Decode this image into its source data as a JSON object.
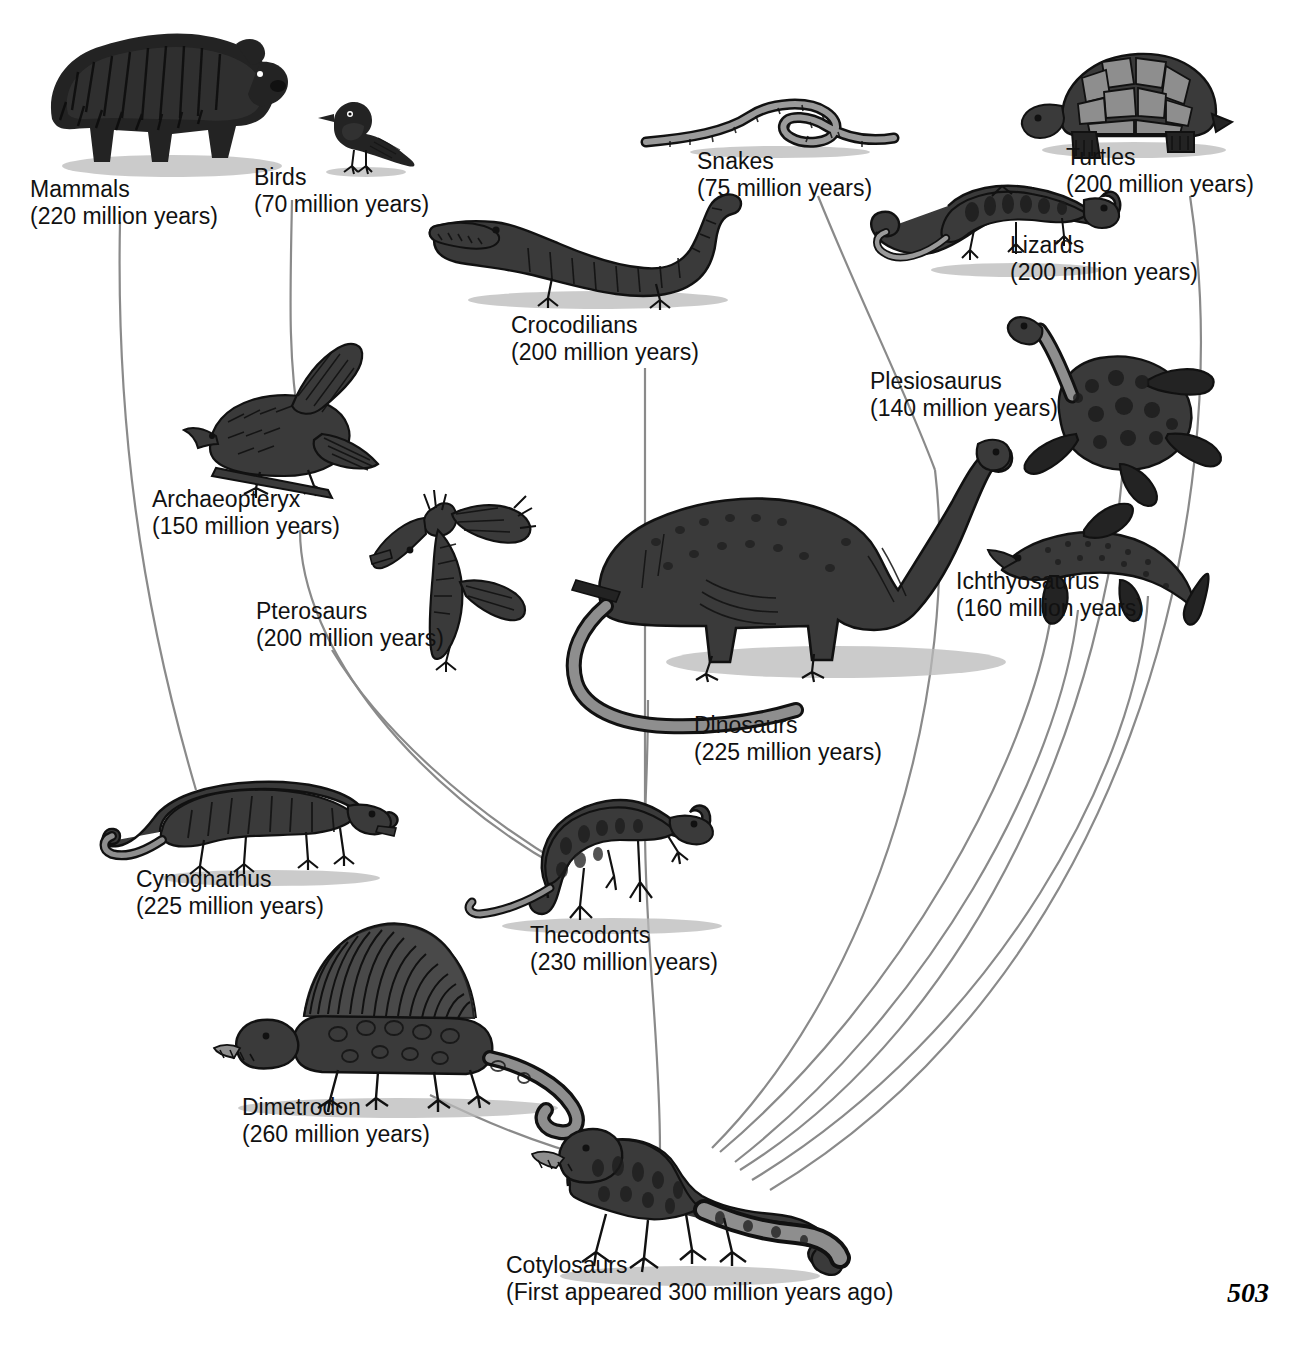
{
  "diagram": {
    "page_number": "503",
    "line_color": "#8a8a8a",
    "background": "#ffffff"
  },
  "taxa": [
    {
      "id": "mammals",
      "name": "Mammals",
      "years": "(220 million years)",
      "icon": "bear-illustration"
    },
    {
      "id": "birds",
      "name": "Birds",
      "years": "(70 million years)",
      "icon": "bird-illustration"
    },
    {
      "id": "snakes",
      "name": "Snakes",
      "years": "(75 million years)",
      "icon": "snake-illustration"
    },
    {
      "id": "turtles",
      "name": "Turtles",
      "years": "(200 million years)",
      "icon": "turtle-illustration"
    },
    {
      "id": "lizards",
      "name": "Lizards",
      "years": "(200 million years)",
      "icon": "lizard-illustration"
    },
    {
      "id": "crocodilians",
      "name": "Crocodilians",
      "years": "(200 million years)",
      "icon": "crocodile-illustration"
    },
    {
      "id": "plesiosaurus",
      "name": "Plesiosaurus",
      "years": "(140 million years)",
      "icon": "plesiosaur-illustration"
    },
    {
      "id": "archaeopteryx",
      "name": "Archaeopteryx",
      "years": "(150 million years)",
      "icon": "archaeopteryx-illustration"
    },
    {
      "id": "pterosaurs",
      "name": "Pterosaurs",
      "years": "(200 million years)",
      "icon": "pterosaur-illustration"
    },
    {
      "id": "ichthyosaurus",
      "name": "Ichthyosaurus",
      "years": "(160 million years)",
      "icon": "ichthyosaur-illustration"
    },
    {
      "id": "dinosaurs",
      "name": "Dinosaurs",
      "years": "(225 million years)",
      "icon": "sauropod-illustration"
    },
    {
      "id": "cynognathus",
      "name": "Cynognathus",
      "years": "(225 million years)",
      "icon": "cynognathus-illustration"
    },
    {
      "id": "thecodonts",
      "name": "Thecodonts",
      "years": "(230 million years)",
      "icon": "thecodont-illustration"
    },
    {
      "id": "dimetrodon",
      "name": "Dimetrodon",
      "years": "(260 million years)",
      "icon": "dimetrodon-illustration"
    },
    {
      "id": "cotylosaurs",
      "name": "Cotylosaurs",
      "years": "(First appeared 300 million years ago)",
      "icon": "cotylosaur-illustration"
    }
  ],
  "branches": [
    {
      "from": "cotylosaurs",
      "to": "cynognathus"
    },
    {
      "from": "cynognathus",
      "to": "mammals"
    },
    {
      "from": "cotylosaurs",
      "to": "dimetrodon"
    },
    {
      "from": "cotylosaurs",
      "to": "thecodonts"
    },
    {
      "from": "thecodonts",
      "to": "crocodilians"
    },
    {
      "from": "thecodonts",
      "to": "pterosaurs"
    },
    {
      "from": "thecodonts",
      "to": "dinosaurs"
    },
    {
      "from": "thecodonts",
      "to": "archaeopteryx"
    },
    {
      "from": "archaeopteryx",
      "to": "birds"
    },
    {
      "from": "cotylosaurs",
      "to": "lizards"
    },
    {
      "from": "lizards",
      "to": "snakes"
    },
    {
      "from": "cotylosaurs",
      "to": "turtles"
    },
    {
      "from": "cotylosaurs",
      "to": "plesiosaurus"
    },
    {
      "from": "cotylosaurs",
      "to": "ichthyosaurus"
    }
  ]
}
